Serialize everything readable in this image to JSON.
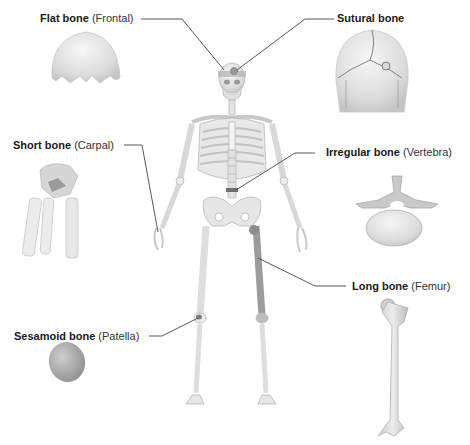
{
  "diagram": {
    "type": "labeled anatomical illustration",
    "central_figure": "full human skeleton (anterior view)",
    "labels": [
      {
        "id": "flat",
        "type": "Flat bone",
        "example": "(Frontal)",
        "points_to": "frontal bone of skull"
      },
      {
        "id": "sutural",
        "type": "Sutural bone",
        "example": "",
        "points_to": "suture on skull"
      },
      {
        "id": "short",
        "type": "Short bone",
        "example": "(Carpal)",
        "points_to": "wrist"
      },
      {
        "id": "irregular",
        "type": "Irregular bone",
        "example": "(Vertebra)",
        "points_to": "lumbar vertebra"
      },
      {
        "id": "long",
        "type": "Long bone",
        "example": "(Femur)",
        "points_to": "femur (thigh)"
      },
      {
        "id": "sesamoid",
        "type": "Sesamoid bone",
        "example": "(Patella)",
        "points_to": "kneecap"
      }
    ],
    "colors": {
      "bone_light": "#ececec",
      "bone_shade": "#c8c8c8",
      "highlight": "#8a8a8a",
      "leader_line": "#444444",
      "text": "#1a1a1a"
    }
  }
}
